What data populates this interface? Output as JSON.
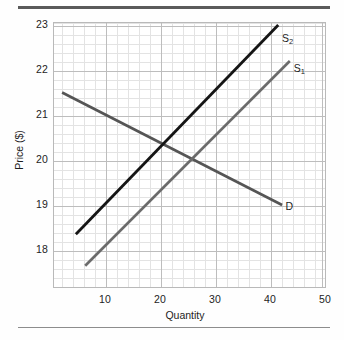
{
  "figure": {
    "top_rule_color": "#5a5a5a",
    "bottom_rule_color": "#8d8d8d",
    "background": "#fefefe"
  },
  "chart_data": {
    "type": "line",
    "title": "",
    "xlabel": "Quantity",
    "ylabel": "Price ($)",
    "xlim": [
      0,
      50
    ],
    "ylim": [
      17.4,
      23
    ],
    "xticks": [
      10,
      20,
      30,
      40,
      50
    ],
    "yticks": [
      18,
      19,
      20,
      21,
      22,
      23
    ],
    "xtick_labels": [
      "10",
      "20",
      "30",
      "40",
      "50"
    ],
    "ytick_labels": [
      "18",
      "19",
      "20",
      "21",
      "22",
      "23"
    ],
    "grid": true,
    "grid_minor": true,
    "grid_major_color": "#bdbdbd",
    "grid_minor_color": "#e3e3e3",
    "legend": "inline-endpoint-labels",
    "series": [
      {
        "name": "D",
        "label": "D",
        "sub": "",
        "role": "demand",
        "color": "#555555",
        "width": 2.6,
        "x": [
          2.2,
          42.2
        ],
        "y": [
          21.5,
          19.0
        ],
        "label_x": 42.8,
        "label_y": 18.98
      },
      {
        "name": "S1",
        "label": "S",
        "sub": "1",
        "role": "supply-original",
        "color": "#6b6b6b",
        "width": 2.6,
        "x": [
          6.4,
          43.6
        ],
        "y": [
          17.65,
          22.2
        ],
        "label_x": 44.3,
        "label_y": 22.05
      },
      {
        "name": "S2",
        "label": "S",
        "sub": "2",
        "role": "supply-shifted",
        "color": "#151515",
        "width": 2.8,
        "x": [
          4.7,
          41.5
        ],
        "y": [
          18.35,
          23.0
        ],
        "label_x": 42.2,
        "label_y": 22.72
      }
    ],
    "intersections": [
      {
        "series": [
          "D",
          "S2"
        ],
        "x": 21.0,
        "y": 20.35
      },
      {
        "series": [
          "D",
          "S1"
        ],
        "x": 26.2,
        "y": 20.0
      }
    ]
  }
}
